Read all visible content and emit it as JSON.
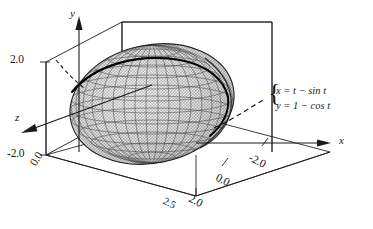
{
  "figure": {
    "type": "3d-surface-plot",
    "background_color": "#ffffff",
    "line_color": "#1a1a1a",
    "surface_fill_color": "#b9b9b9",
    "surface_mesh_color": "#2b2b2b",
    "highlight_curve_color": "#000000"
  },
  "axes": {
    "y": {
      "label": "y",
      "orientation": "vertical-up",
      "arrow": true,
      "ticks": [
        {
          "value": "2.0",
          "position": "upper-left"
        },
        {
          "value": "-2.0",
          "position": "lower-left"
        }
      ]
    },
    "z": {
      "label": "z",
      "orientation": "down-left-depth",
      "arrow": true,
      "ticks": [
        {
          "value": "0.0",
          "position": "lower-left-origin"
        }
      ]
    },
    "x": {
      "label": "x",
      "orientation": "right",
      "arrow": true,
      "ticks": [
        {
          "value": "-2.0",
          "position": "right-front"
        },
        {
          "value": "0.0",
          "position": "bottom-middle"
        },
        {
          "value": "2.0",
          "position": "bottom-left-front"
        },
        {
          "value": "2.5",
          "position": "bottom-far-left-clipped"
        }
      ]
    }
  },
  "callout": {
    "brace": "{",
    "equations": [
      {
        "lhs": "x",
        "eq": "=",
        "rhs_first": "t",
        "op": "−",
        "rhs_second": "sin t",
        "full": "x = t − sin t"
      },
      {
        "lhs": "y",
        "eq": "=",
        "rhs_first": "1",
        "op": "−",
        "rhs_second": "cos t",
        "full": "y = 1 − cos t"
      }
    ],
    "leader_line_style": "dashed"
  },
  "annotations": {
    "leader_dashes_left": "dashed segment pointing at upper-left of ellipsoid",
    "leader_dashes_right": "dashed arc from ellipsoid right edge to equation brace"
  }
}
